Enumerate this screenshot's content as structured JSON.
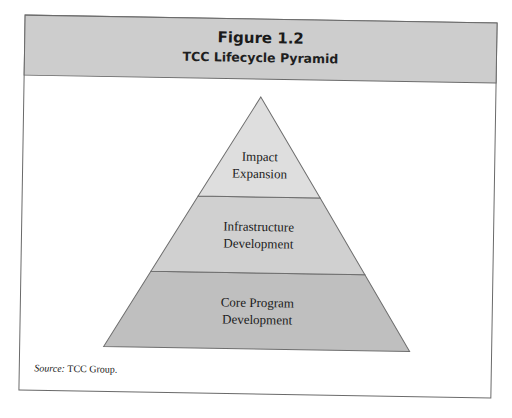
{
  "figure": {
    "label": "Figure 1.2",
    "title": "TCC Lifecycle Pyramid"
  },
  "pyramid": {
    "tiers": [
      {
        "position": "top",
        "lines": [
          "Impact",
          "Expansion"
        ],
        "fill": "#dedede"
      },
      {
        "position": "middle",
        "lines": [
          "Infrastructure",
          "Development"
        ],
        "fill": "#d0d0d0"
      },
      {
        "position": "bottom",
        "lines": [
          "Core Program",
          "Development"
        ],
        "fill": "#bfbfbf"
      }
    ],
    "stroke": "#6e6e6e"
  },
  "source": {
    "label": "Source:",
    "text": " TCC Group."
  },
  "colors": {
    "header_bg": "#cdcdcd",
    "frame": "#6a6a6a",
    "body_bg": "#ffffff"
  }
}
